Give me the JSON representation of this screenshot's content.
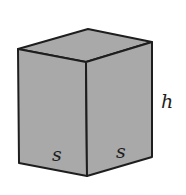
{
  "figure": {
    "type": "rectangular prism with square base",
    "colors": {
      "fill": "#a9a9a9",
      "stroke": "#1e1e1e",
      "background": "#ffffff"
    },
    "labels": {
      "front_base_edge": "s",
      "side_base_edge": "s",
      "height": "h"
    }
  }
}
